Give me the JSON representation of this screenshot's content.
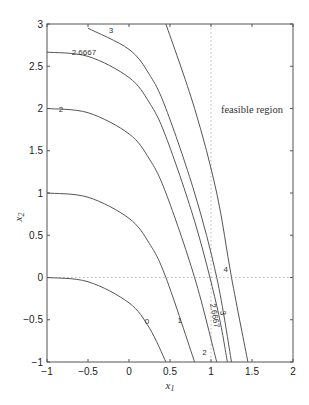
{
  "chart_data": {
    "type": "line",
    "title": "",
    "xlabel": "x1",
    "ylabel": "x2",
    "xlim": [
      -1,
      2
    ],
    "ylim": [
      -1,
      3
    ],
    "xticks": [
      "-1",
      "-0.5",
      "0",
      "0.5",
      "1",
      "1.5",
      "2"
    ],
    "yticks": [
      "-1",
      "-0.5",
      "0",
      "0.5",
      "1",
      "1.5",
      "2",
      "2.5",
      "3"
    ],
    "grid": false,
    "annotations": [
      {
        "text": "feasible region",
        "x": 1.5,
        "y": 2
      }
    ],
    "constraint_lines": [
      {
        "name": "x1 = 1",
        "style": "dotted",
        "x": 1
      },
      {
        "name": "x2 = 0",
        "style": "dotted",
        "y": 0
      }
    ],
    "series": [
      {
        "name": "0",
        "label": "0",
        "x": [
          -1,
          -0.5,
          0,
          0.25,
          0.45
        ],
        "y": [
          0,
          -0.05,
          -0.3,
          -0.6,
          -1
        ]
      },
      {
        "name": "1",
        "label": "1",
        "x": [
          -1,
          -0.5,
          0,
          0.25,
          0.45,
          0.8
        ],
        "y": [
          1,
          0.95,
          0.7,
          0.4,
          0,
          -1
        ]
      },
      {
        "name": "2",
        "label": "2",
        "x": [
          -1,
          -0.5,
          0,
          0.25,
          0.45,
          0.8,
          1.07
        ],
        "y": [
          2,
          1.95,
          1.7,
          1.4,
          1,
          0,
          -1
        ]
      },
      {
        "name": "2.6667",
        "label": "2.6667",
        "x": [
          -1,
          -0.5,
          0,
          0.25,
          0.45,
          0.8,
          1.07,
          1.2
        ],
        "y": [
          2.6667,
          2.6167,
          2.3667,
          2.0667,
          1.6667,
          0.6667,
          -0.3333,
          -1
        ]
      },
      {
        "name": "3",
        "label": "3",
        "x": [
          -0.5,
          0,
          0.25,
          0.45,
          0.8,
          1.07,
          1.25
        ],
        "y": [
          2.95,
          2.7,
          2.4,
          2,
          1,
          0,
          -1
        ]
      },
      {
        "name": "4",
        "label": "4",
        "x": [
          0.45,
          0.8,
          1.07,
          1.25,
          1.45
        ],
        "y": [
          3,
          2,
          1,
          0,
          -1
        ]
      }
    ]
  }
}
